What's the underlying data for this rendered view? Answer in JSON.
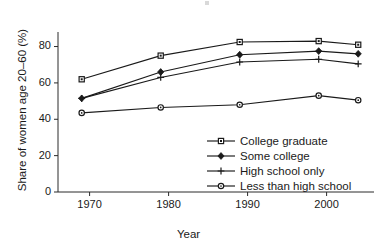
{
  "chart_data": {
    "type": "line",
    "title": "",
    "xlabel": "Year",
    "ylabel": "Share of women age 20–60 (%)",
    "x": [
      1969,
      1979,
      1989,
      1999,
      2004
    ],
    "xlim": [
      1966,
      2006
    ],
    "ylim": [
      0,
      88
    ],
    "xticks": [
      1970,
      1980,
      1990,
      2000
    ],
    "xtick_labels": [
      "1970",
      "1980",
      "1990",
      "2000"
    ],
    "yticks": [
      0,
      20,
      40,
      60,
      80
    ],
    "ytick_labels": [
      "0",
      "20",
      "40",
      "60",
      "80"
    ],
    "grid": false,
    "legend_position": "lower right",
    "series": [
      {
        "name": "College graduate",
        "marker": "open-square",
        "values": [
          62.0,
          75.0,
          82.5,
          83.0,
          81.0
        ]
      },
      {
        "name": "Some college",
        "marker": "filled-diamond",
        "values": [
          51.5,
          66.0,
          75.5,
          77.5,
          76.0
        ]
      },
      {
        "name": "High school only",
        "marker": "plus",
        "values": [
          51.5,
          63.0,
          71.5,
          73.0,
          70.5
        ]
      },
      {
        "name": "Less than high school",
        "marker": "open-circle",
        "values": [
          43.5,
          46.5,
          48.0,
          53.0,
          50.5
        ]
      }
    ]
  },
  "colors": {
    "line": "#1a1a1a",
    "axis": "#2a2a2a",
    "background": "#ffffff"
  }
}
